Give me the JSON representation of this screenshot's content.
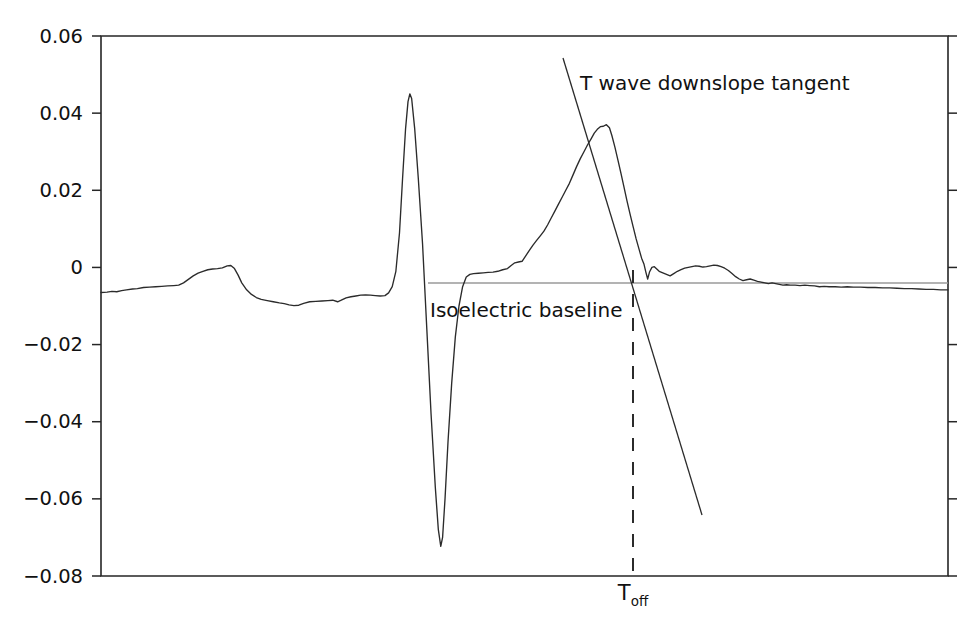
{
  "chart_data": {
    "type": "line",
    "title": "",
    "xlabel": "",
    "ylabel": "",
    "xlim": [
      0,
      1
    ],
    "ylim": [
      -0.08,
      0.06
    ],
    "grid": false,
    "legend": "none",
    "y_ticks": [
      "0.06",
      "0.04",
      "0.02",
      "0",
      "−0.02",
      "−0.04",
      "−0.06",
      "−0.08"
    ],
    "y_tick_values": [
      0.06,
      0.04,
      0.02,
      0,
      -0.02,
      -0.04,
      -0.06,
      -0.08
    ],
    "x_ticks": [],
    "x_tick_labels": [],
    "series": [
      {
        "name": "ECG beat",
        "color": "#2b2b2b",
        "points": [
          [
            0.0,
            -0.0065
          ],
          [
            0.01,
            -0.0064
          ],
          [
            0.018,
            -0.0062
          ],
          [
            0.026,
            -0.0063
          ],
          [
            0.034,
            -0.006
          ],
          [
            0.042,
            -0.0058
          ],
          [
            0.052,
            -0.0056
          ],
          [
            0.06,
            -0.0055
          ],
          [
            0.07,
            -0.0052
          ],
          [
            0.08,
            -0.0051
          ],
          [
            0.09,
            -0.005
          ],
          [
            0.1,
            -0.0049
          ],
          [
            0.11,
            -0.0048
          ],
          [
            0.12,
            -0.0047
          ],
          [
            0.128,
            -0.0046
          ],
          [
            0.136,
            -0.004
          ],
          [
            0.144,
            -0.0031
          ],
          [
            0.152,
            -0.0022
          ],
          [
            0.16,
            -0.0015
          ],
          [
            0.168,
            -0.001
          ],
          [
            0.176,
            -0.0006
          ],
          [
            0.184,
            -0.0004
          ],
          [
            0.192,
            -0.0003
          ],
          [
            0.2,
            -0.0001
          ],
          [
            0.208,
            0.0004
          ],
          [
            0.214,
            0.0005
          ],
          [
            0.22,
            -0.0003
          ],
          [
            0.226,
            -0.002
          ],
          [
            0.232,
            -0.004
          ],
          [
            0.24,
            -0.0058
          ],
          [
            0.248,
            -0.007
          ],
          [
            0.256,
            -0.0078
          ],
          [
            0.264,
            -0.0083
          ],
          [
            0.274,
            -0.0086
          ],
          [
            0.284,
            -0.0089
          ],
          [
            0.294,
            -0.0092
          ],
          [
            0.302,
            -0.0094
          ],
          [
            0.31,
            -0.0097
          ],
          [
            0.318,
            -0.0099
          ],
          [
            0.326,
            -0.0098
          ],
          [
            0.334,
            -0.0093
          ],
          [
            0.344,
            -0.0089
          ],
          [
            0.354,
            -0.0088
          ],
          [
            0.364,
            -0.0087
          ],
          [
            0.374,
            -0.0086
          ],
          [
            0.382,
            -0.0085
          ],
          [
            0.39,
            -0.0089
          ],
          [
            0.396,
            -0.0085
          ],
          [
            0.404,
            -0.0079
          ],
          [
            0.412,
            -0.0076
          ],
          [
            0.42,
            -0.0074
          ],
          [
            0.428,
            -0.0072
          ],
          [
            0.436,
            -0.0071
          ],
          [
            0.444,
            -0.0072
          ],
          [
            0.452,
            -0.0073
          ],
          [
            0.46,
            -0.0074
          ],
          [
            0.468,
            -0.0073
          ],
          [
            0.474,
            -0.0066
          ],
          [
            0.48,
            -0.005
          ],
          [
            0.486,
            -0.001
          ],
          [
            0.492,
            0.009
          ],
          [
            0.497,
            0.023
          ],
          [
            0.502,
            0.036
          ],
          [
            0.506,
            0.043
          ],
          [
            0.509,
            0.045
          ],
          [
            0.512,
            0.0438
          ],
          [
            0.517,
            0.036
          ],
          [
            0.523,
            0.023
          ],
          [
            0.53,
            0.006
          ],
          [
            0.537,
            -0.016
          ],
          [
            0.544,
            -0.038
          ],
          [
            0.551,
            -0.057
          ],
          [
            0.556,
            -0.068
          ],
          [
            0.56,
            -0.0723
          ],
          [
            0.563,
            -0.07
          ],
          [
            0.567,
            -0.06
          ],
          [
            0.572,
            -0.045
          ],
          [
            0.578,
            -0.03
          ],
          [
            0.584,
            -0.018
          ],
          [
            0.59,
            -0.01
          ],
          [
            0.596,
            -0.005
          ],
          [
            0.602,
            -0.0025
          ],
          [
            0.608,
            -0.0018
          ],
          [
            0.614,
            -0.0016
          ],
          [
            0.622,
            -0.0015
          ],
          [
            0.63,
            -0.0014
          ],
          [
            0.638,
            -0.0013
          ],
          [
            0.646,
            -0.0012
          ],
          [
            0.654,
            -0.001
          ],
          [
            0.662,
            -0.0006
          ],
          [
            0.67,
            -0.0003
          ],
          [
            0.676,
            0.0005
          ],
          [
            0.682,
            0.0012
          ],
          [
            0.688,
            0.0014
          ],
          [
            0.694,
            0.0016
          ],
          [
            0.7,
            0.003
          ],
          [
            0.706,
            0.0044
          ],
          [
            0.712,
            0.0058
          ],
          [
            0.718,
            0.007
          ],
          [
            0.724,
            0.0082
          ],
          [
            0.73,
            0.0094
          ],
          [
            0.736,
            0.011
          ],
          [
            0.742,
            0.0128
          ],
          [
            0.748,
            0.0146
          ],
          [
            0.754,
            0.0164
          ],
          [
            0.76,
            0.0182
          ],
          [
            0.766,
            0.02
          ],
          [
            0.772,
            0.0218
          ],
          [
            0.778,
            0.024
          ],
          [
            0.784,
            0.0262
          ],
          [
            0.79,
            0.0282
          ],
          [
            0.796,
            0.03
          ],
          [
            0.802,
            0.0318
          ],
          [
            0.808,
            0.0334
          ],
          [
            0.813,
            0.0348
          ],
          [
            0.818,
            0.0358
          ],
          [
            0.823,
            0.0365
          ],
          [
            0.828,
            0.0366
          ],
          [
            0.833,
            0.037
          ],
          [
            0.838,
            0.0362
          ],
          [
            0.842,
            0.0342
          ],
          [
            0.847,
            0.0312
          ],
          [
            0.852,
            0.0278
          ],
          [
            0.857,
            0.0244
          ],
          [
            0.862,
            0.0208
          ],
          [
            0.867,
            0.0172
          ],
          [
            0.872,
            0.0138
          ],
          [
            0.877,
            0.0106
          ],
          [
            0.882,
            0.0074
          ],
          [
            0.887,
            0.0046
          ],
          [
            0.891,
            0.0024
          ],
          [
            0.895,
            0.0008
          ],
          [
            0.898,
            -0.0012
          ],
          [
            0.901,
            -0.003
          ],
          [
            0.904,
            -0.0012
          ],
          [
            0.908,
            0.0
          ],
          [
            0.912,
            0.0002
          ],
          [
            0.916,
            -0.0004
          ],
          [
            0.92,
            -0.001
          ],
          [
            0.926,
            -0.0014
          ],
          [
            0.932,
            -0.0018
          ],
          [
            0.938,
            -0.0022
          ],
          [
            0.944,
            -0.0016
          ],
          [
            0.95,
            -0.001
          ],
          [
            0.956,
            -0.0006
          ],
          [
            0.962,
            -0.0002
          ],
          [
            0.968,
            0.0
          ],
          [
            0.974,
            0.0002
          ],
          [
            0.98,
            0.0004
          ],
          [
            0.986,
            0.0003
          ],
          [
            0.992,
            0.0001
          ],
          [
            0.998,
            0.0002
          ],
          [
            1.004,
            0.0004
          ],
          [
            1.01,
            0.0006
          ],
          [
            1.016,
            0.0005
          ],
          [
            1.022,
            0.0002
          ],
          [
            1.028,
            -0.0002
          ],
          [
            1.034,
            -0.0008
          ],
          [
            1.04,
            -0.0016
          ],
          [
            1.046,
            -0.0024
          ],
          [
            1.052,
            -0.003
          ],
          [
            1.058,
            -0.0034
          ],
          [
            1.064,
            -0.0032
          ],
          [
            1.07,
            -0.003
          ],
          [
            1.076,
            -0.0033
          ],
          [
            1.082,
            -0.0036
          ],
          [
            1.088,
            -0.0038
          ],
          [
            1.094,
            -0.004
          ],
          [
            1.1,
            -0.0042
          ],
          [
            1.106,
            -0.004
          ],
          [
            1.112,
            -0.0042
          ],
          [
            1.118,
            -0.0044
          ],
          [
            1.124,
            -0.0046
          ],
          [
            1.13,
            -0.0045
          ],
          [
            1.136,
            -0.0046
          ],
          [
            1.144,
            -0.0046
          ],
          [
            1.152,
            -0.0047
          ],
          [
            1.16,
            -0.0046
          ],
          [
            1.168,
            -0.0047
          ],
          [
            1.176,
            -0.0048
          ],
          [
            1.184,
            -0.005
          ],
          [
            1.192,
            -0.0049
          ],
          [
            1.2,
            -0.005
          ],
          [
            1.21,
            -0.005
          ],
          [
            1.22,
            -0.0051
          ],
          [
            1.23,
            -0.005
          ],
          [
            1.24,
            -0.0051
          ],
          [
            1.252,
            -0.0051
          ],
          [
            1.264,
            -0.0052
          ],
          [
            1.276,
            -0.0052
          ],
          [
            1.288,
            -0.0053
          ],
          [
            1.3,
            -0.0053
          ],
          [
            1.312,
            -0.0054
          ],
          [
            1.324,
            -0.0055
          ],
          [
            1.336,
            -0.0055
          ],
          [
            1.348,
            -0.0056
          ],
          [
            1.36,
            -0.0057
          ],
          [
            1.372,
            -0.0057
          ],
          [
            1.384,
            -0.0058
          ],
          [
            1.396,
            -0.0058
          ]
        ]
      }
    ],
    "annotations": [
      {
        "id": "tangent",
        "label": "T wave downslope tangent",
        "kind": "line",
        "x_px": [
          563,
          702
        ],
        "y_px": [
          58,
          515
        ],
        "text_x_px": 580,
        "text_y_px": 84
      },
      {
        "id": "isoelectric",
        "label": "Isoelectric baseline",
        "kind": "hline",
        "value": -0.004,
        "x_start_px": 428,
        "x_end_px": 948,
        "y_px": 283,
        "color": "#9a9a9a",
        "text_x_px": 430,
        "text_y_px": 311
      },
      {
        "id": "toff",
        "label": "T",
        "sublabel": "off",
        "kind": "vline-dashed",
        "x_px": 633,
        "y_start_px": 270,
        "y_end_px": 576,
        "text_y_px": 600
      }
    ],
    "axes_px": {
      "left": 101,
      "right": 948,
      "top": 36,
      "bottom": 576
    }
  },
  "annotations": {
    "tangent_label": "T wave downslope tangent",
    "baseline_label": "Isoelectric baseline",
    "toff_label": "T",
    "toff_sublabel": "off"
  },
  "axis": {
    "y_labels": [
      "0.06",
      "0.04",
      "0.02",
      "0",
      "−0.02",
      "−0.04",
      "−0.06",
      "−0.08"
    ]
  },
  "colors": {
    "trace": "#2b2b2b",
    "axis": "#262626",
    "baseline": "#9a9a9a",
    "text": "#111111",
    "background": "#ffffff"
  }
}
